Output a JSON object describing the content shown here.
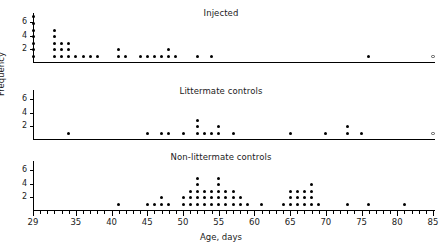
{
  "figure": {
    "xlabel": "Age, days",
    "ylabel": "Frequency"
  },
  "chart_data": {
    "type": "scatter",
    "title": "",
    "xlabel": "Age, days",
    "ylabel": "Frequency",
    "xlim": [
      29,
      85
    ],
    "ylim": [
      0,
      7
    ],
    "xticks_major": [
      29,
      35,
      40,
      45,
      50,
      55,
      60,
      65,
      70,
      75,
      80,
      85
    ],
    "xticks_minor_step": 1,
    "yticks": [
      2,
      4,
      6
    ],
    "grid": false,
    "legend": "none",
    "marker_note": "filled circles are observed deaths; open circle at 85 days denotes censored/surviving animals",
    "panels": [
      {
        "title": "Injected",
        "series": [
          {
            "name": "counts",
            "marker": "filled",
            "x": [
              29,
              32,
              33,
              34,
              35,
              36,
              37,
              38,
              41,
              42,
              44,
              45,
              46,
              47,
              48,
              49,
              52,
              54,
              76
            ],
            "counts": [
              7,
              5,
              3,
              3,
              1,
              1,
              1,
              1,
              2,
              1,
              1,
              1,
              1,
              1,
              2,
              1,
              1,
              1,
              1
            ]
          },
          {
            "name": "censored",
            "marker": "open",
            "x": [
              85
            ],
            "counts": [
              1
            ]
          }
        ]
      },
      {
        "title": "Littermate controls",
        "series": [
          {
            "name": "counts",
            "marker": "filled",
            "x": [
              34,
              45,
              47,
              48,
              50,
              52,
              53,
              54,
              55,
              57,
              65,
              70,
              73,
              75
            ],
            "counts": [
              1,
              1,
              1,
              1,
              1,
              3,
              1,
              1,
              2,
              1,
              1,
              1,
              2,
              1
            ]
          },
          {
            "name": "censored",
            "marker": "open",
            "x": [
              85
            ],
            "counts": [
              1
            ]
          }
        ]
      },
      {
        "title": "Non-littermate controls",
        "series": [
          {
            "name": "counts",
            "marker": "filled",
            "x": [
              41,
              45,
              46,
              47,
              48,
              50,
              51,
              52,
              53,
              54,
              55,
              56,
              57,
              58,
              59,
              61,
              64,
              65,
              66,
              67,
              68,
              69,
              73,
              76,
              81
            ],
            "counts": [
              1,
              1,
              1,
              2,
              1,
              2,
              3,
              5,
              3,
              3,
              5,
              3,
              3,
              2,
              1,
              1,
              1,
              3,
              3,
              3,
              4,
              1,
              1,
              1,
              1
            ]
          }
        ]
      }
    ]
  }
}
